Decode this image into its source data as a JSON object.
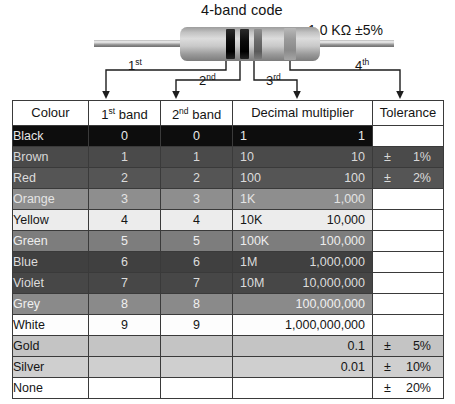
{
  "diagram": {
    "title": "4-band code",
    "value_label": "1.0 KΩ ±5%",
    "band_labels": [
      {
        "text": "1",
        "sup": "st"
      },
      {
        "text": "2",
        "sup": "nd"
      },
      {
        "text": "3",
        "sup": "rd"
      },
      {
        "text": "4",
        "sup": "th"
      }
    ],
    "bands": [
      {
        "name": "band-1-black",
        "colour": "Black"
      },
      {
        "name": "band-2-black",
        "colour": "Black"
      },
      {
        "name": "band-3-red",
        "colour": "Red"
      },
      {
        "name": "band-4-gold",
        "colour": "Gold"
      }
    ]
  },
  "table": {
    "headers": [
      {
        "label": "Colour",
        "sup": ""
      },
      {
        "label": "1",
        "sup": "st",
        "suffix": " band"
      },
      {
        "label": "2",
        "sup": "nd",
        "suffix": " band"
      },
      {
        "label": "Decimal multiplier",
        "sup": ""
      },
      {
        "label": "Tolerance",
        "sup": ""
      }
    ],
    "rows": [
      {
        "colour": "Black",
        "band1": "0",
        "band2": "0",
        "mult_short": "1",
        "mult_full": "1",
        "tol_sign": "",
        "tol_value": "",
        "tol_blank_white": true
      },
      {
        "colour": "Brown",
        "band1": "1",
        "band2": "1",
        "mult_short": "10",
        "mult_full": "10",
        "tol_sign": "±",
        "tol_value": "1%",
        "tol_blank_white": false
      },
      {
        "colour": "Red",
        "band1": "2",
        "band2": "2",
        "mult_short": "100",
        "mult_full": "100",
        "tol_sign": "±",
        "tol_value": "2%",
        "tol_blank_white": false
      },
      {
        "colour": "Orange",
        "band1": "3",
        "band2": "3",
        "mult_short": "1K",
        "mult_full": "1,000",
        "tol_sign": "",
        "tol_value": "",
        "tol_blank_white": true
      },
      {
        "colour": "Yellow",
        "band1": "4",
        "band2": "4",
        "mult_short": "10K",
        "mult_full": "10,000",
        "tol_sign": "",
        "tol_value": "",
        "tol_blank_white": true
      },
      {
        "colour": "Green",
        "band1": "5",
        "band2": "5",
        "mult_short": "100K",
        "mult_full": "100,000",
        "tol_sign": "",
        "tol_value": "",
        "tol_blank_white": true
      },
      {
        "colour": "Blue",
        "band1": "6",
        "band2": "6",
        "mult_short": "1M",
        "mult_full": "1,000,000",
        "tol_sign": "",
        "tol_value": "",
        "tol_blank_white": true
      },
      {
        "colour": "Violet",
        "band1": "7",
        "band2": "7",
        "mult_short": "10M",
        "mult_full": "10,000,000",
        "tol_sign": "",
        "tol_value": "",
        "tol_blank_white": true
      },
      {
        "colour": "Grey",
        "band1": "8",
        "band2": "8",
        "mult_short": "",
        "mult_full": "100,000,000",
        "tol_sign": "",
        "tol_value": "",
        "tol_blank_white": true
      },
      {
        "colour": "White",
        "band1": "9",
        "band2": "9",
        "mult_short": "",
        "mult_full": "1,000,000,000",
        "tol_sign": "",
        "tol_value": "",
        "tol_blank_white": true
      },
      {
        "colour": "Gold",
        "band1": "",
        "band2": "",
        "mult_short": "",
        "mult_full": "0.1",
        "tol_sign": "±",
        "tol_value": "5%",
        "tol_blank_white": false
      },
      {
        "colour": "Silver",
        "band1": "",
        "band2": "",
        "mult_short": "",
        "mult_full": "0.01",
        "tol_sign": "±",
        "tol_value": "10%",
        "tol_blank_white": false
      },
      {
        "colour": "None",
        "band1": "",
        "band2": "",
        "mult_short": "",
        "mult_full": "",
        "tol_sign": "±",
        "tol_value": "20%",
        "tol_blank_white": false
      }
    ]
  }
}
